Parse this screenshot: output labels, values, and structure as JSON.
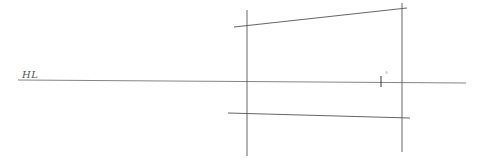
{
  "diagram": {
    "type": "perspective-sketch",
    "labels": {
      "horizon": "HL",
      "vanishing_mark": "°"
    },
    "colors": {
      "background": "#ffffff",
      "stroke": "#555555",
      "stroke_light": "#888888"
    },
    "lines": {
      "horizon_line": {
        "x1": 18,
        "y1": 80,
        "x2": 466,
        "y2": 83
      },
      "left_vertical": {
        "x1": 247,
        "y1": 10,
        "x2": 247,
        "y2": 156
      },
      "right_vertical": {
        "x1": 402,
        "y1": 3,
        "x2": 402,
        "y2": 152
      },
      "top_edge": {
        "x1": 234,
        "y1": 27,
        "x2": 407,
        "y2": 8
      },
      "bottom_edge": {
        "x1": 228,
        "y1": 113,
        "x2": 410,
        "y2": 118
      },
      "tick_mark": {
        "x1": 381,
        "y1": 76,
        "x2": 381,
        "y2": 87
      }
    }
  }
}
